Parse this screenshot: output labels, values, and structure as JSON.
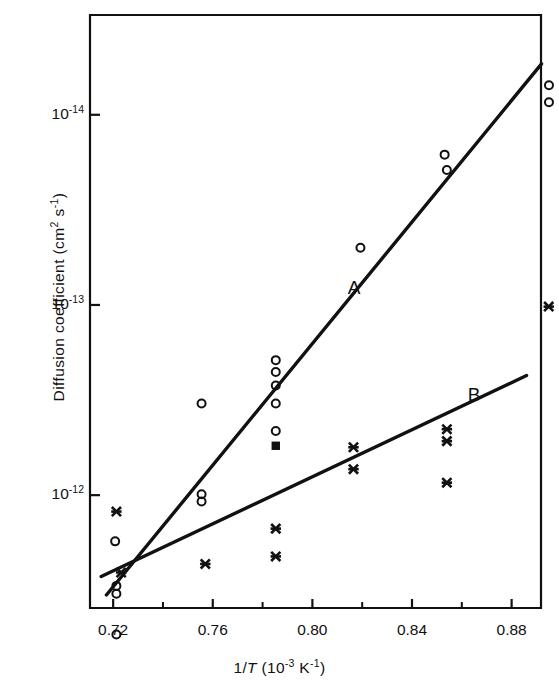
{
  "chart_data": {
    "type": "scatter",
    "title": "",
    "xlabel": "1/T (10^-3 K^-1)",
    "xlabel_parts": {
      "prefix": "1/",
      "italic": "T",
      "mid": " (10",
      "sup1": "-3",
      "mid2": " K",
      "sup2": "-1",
      "suffix": ")"
    },
    "ylabel": "Diffusion coefficient (cm^2 s^-1)",
    "ylabel_parts": {
      "main": "Diffusion coefficient  (cm",
      "sup1": "2",
      "mid": " s",
      "sup2": "-1",
      "suffix": ")"
    },
    "xlim": [
      0.7107,
      0.8918
    ],
    "ylim_exp": [
      -14.5247,
      -11.4066
    ],
    "yscale": "log",
    "grid": false,
    "legend_position": "inline-annotation",
    "x_ticks_major": [
      0.72,
      0.76,
      0.8,
      0.84,
      0.88
    ],
    "x_tick_labels": [
      "0.72",
      "0.76",
      "0.80",
      "0.84",
      "0.88"
    ],
    "x_ticks_minor": [
      0.74,
      0.78,
      0.82,
      0.86
    ],
    "y_ticks_major": [
      1e-12,
      1e-13,
      1e-14
    ],
    "y_tick_labels": [
      "10-12",
      "10-13",
      "10-14"
    ],
    "y_tick_mantissas": [
      "10",
      "10",
      "10"
    ],
    "y_tick_exponents": [
      "-12",
      "-13",
      "-14"
    ],
    "annotations": [
      {
        "text": "A",
        "x": 0.8167,
        "y_exp": -13.086,
        "name": "series-label-a"
      },
      {
        "text": "B",
        "x": 0.8649,
        "y_exp": -12.522,
        "name": "series-label-b"
      }
    ],
    "series": [
      {
        "name": "open circles (line A data)",
        "marker": "open-circle",
        "points": [
          {
            "x": 0.7213,
            "y": 5.4e-12
          },
          {
            "x": 0.7213,
            "y": 3.3e-12
          },
          {
            "x": 0.7213,
            "y": 3e-12
          },
          {
            "x": 0.7208,
            "y": 1.75e-12
          },
          {
            "x": 0.7555,
            "y": 1.08e-12
          },
          {
            "x": 0.7555,
            "y": 9.9e-13
          },
          {
            "x": 0.7555,
            "y": 3.3e-13
          },
          {
            "x": 0.7853,
            "y": 4.6e-13
          },
          {
            "x": 0.7853,
            "y": 3.3e-13
          },
          {
            "x": 0.7853,
            "y": 2.65e-13
          },
          {
            "x": 0.7853,
            "y": 2.25e-13
          },
          {
            "x": 0.7853,
            "y": 1.95e-13
          },
          {
            "x": 0.8193,
            "y": 5e-14
          },
          {
            "x": 0.854,
            "y": 1.95e-14
          },
          {
            "x": 0.8531,
            "y": 1.62e-14
          },
          {
            "x": 0.895,
            "y": 8.6e-15
          },
          {
            "x": 0.895,
            "y": 7e-15
          }
        ]
      },
      {
        "name": "crosses (line B data)",
        "marker": "cross",
        "points": [
          {
            "x": 0.7232,
            "y": 2.55e-12
          },
          {
            "x": 0.7213,
            "y": 1.22e-12
          },
          {
            "x": 0.757,
            "y": 2.3e-12
          },
          {
            "x": 0.7853,
            "y": 2.1e-12
          },
          {
            "x": 0.7853,
            "y": 1.5e-12
          },
          {
            "x": 0.8165,
            "y": 7.3e-13
          },
          {
            "x": 0.8165,
            "y": 5.6e-13
          },
          {
            "x": 0.854,
            "y": 8.6e-13
          },
          {
            "x": 0.854,
            "y": 5.2e-13
          },
          {
            "x": 0.854,
            "y": 4.5e-13
          },
          {
            "x": 0.8949,
            "y": 1.02e-13
          }
        ]
      },
      {
        "name": "filled square",
        "marker": "filled-square",
        "points": [
          {
            "x": 0.7853,
            "y": 5.5e-13
          }
        ]
      }
    ],
    "fit_lines": [
      {
        "name": "A",
        "label": "A",
        "x_start": 0.7173,
        "y_start": 3.35e-12,
        "x_end": 0.892,
        "y_end": 5.4e-15
      },
      {
        "name": "B",
        "label": "B",
        "x_start": 0.7152,
        "y_start": 2.68e-12,
        "x_end": 0.886,
        "y_end": 2.35e-13
      }
    ]
  },
  "figure": {
    "background_color": "#ffffff",
    "ink_color": "#111111"
  }
}
